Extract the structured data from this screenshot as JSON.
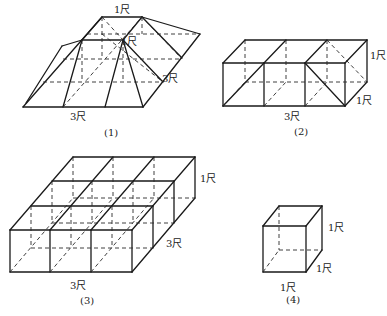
{
  "figures": [
    {
      "id": "fig1",
      "caption": "(1)",
      "caption_pos": [
        104,
        136
      ],
      "labels": [
        {
          "text": "1尺",
          "x": 114,
          "y": 13
        },
        {
          "text": "1尺",
          "x": 121,
          "y": 45
        },
        {
          "text": "3尺",
          "x": 162,
          "y": 82
        },
        {
          "text": "3尺",
          "x": 70,
          "y": 120
        }
      ],
      "solid": [
        [
          [
            23,
            107
          ],
          [
            143,
            107
          ]
        ],
        [
          [
            143,
            107
          ],
          [
            200,
            34
          ]
        ],
        [
          [
            200,
            34
          ],
          [
            142,
            17
          ]
        ],
        [
          [
            142,
            17
          ],
          [
            102,
            17
          ]
        ],
        [
          [
            102,
            17
          ],
          [
            23,
            107
          ]
        ],
        [
          [
            102,
            17
          ],
          [
            82,
            40
          ]
        ],
        [
          [
            82,
            40
          ],
          [
            123,
            40
          ]
        ],
        [
          [
            142,
            17
          ],
          [
            123,
            40
          ]
        ],
        [
          [
            82,
            40
          ],
          [
            63,
            107
          ]
        ],
        [
          [
            123,
            40
          ],
          [
            105,
            107
          ]
        ],
        [
          [
            123,
            40
          ],
          [
            143,
            107
          ]
        ],
        [
          [
            142,
            17
          ],
          [
            182,
            58
          ]
        ],
        [
          [
            123,
            40
          ],
          [
            163,
            82
          ]
        ],
        [
          [
            82,
            40
          ],
          [
            62,
            46
          ]
        ],
        [
          [
            62,
            46
          ],
          [
            26,
            103
          ]
        ]
      ],
      "dash": [
        [
          [
            63,
            59
          ],
          [
            182,
            59
          ]
        ],
        [
          [
            43,
            82
          ],
          [
            163,
            82
          ]
        ],
        [
          [
            87,
            34
          ],
          [
            200,
            34
          ]
        ],
        [
          [
            102,
            17
          ],
          [
            102,
            59
          ]
        ],
        [
          [
            142,
            17
          ],
          [
            142,
            34
          ]
        ],
        [
          [
            82,
            40
          ],
          [
            82,
            82
          ]
        ],
        [
          [
            123,
            40
          ],
          [
            123,
            82
          ]
        ],
        [
          [
            102,
            17
          ],
          [
            123,
            40
          ]
        ],
        [
          [
            63,
            107
          ],
          [
            142,
            17
          ]
        ],
        [
          [
            102,
            34
          ],
          [
            163,
            82
          ]
        ],
        [
          [
            142,
            17
          ],
          [
            182,
            59
          ]
        ]
      ]
    },
    {
      "id": "fig2",
      "caption": "(2)",
      "caption_pos": [
        294,
        135
      ],
      "labels": [
        {
          "text": "1尺",
          "x": 370,
          "y": 59
        },
        {
          "text": "1尺",
          "x": 356,
          "y": 104
        },
        {
          "text": "3尺",
          "x": 284,
          "y": 120
        }
      ],
      "solid": [
        [
          [
            223,
            63
          ],
          [
            345,
            63
          ]
        ],
        [
          [
            223,
            106
          ],
          [
            345,
            106
          ]
        ],
        [
          [
            223,
            63
          ],
          [
            223,
            106
          ]
        ],
        [
          [
            264,
            63
          ],
          [
            264,
            106
          ]
        ],
        [
          [
            305,
            63
          ],
          [
            305,
            106
          ]
        ],
        [
          [
            345,
            63
          ],
          [
            345,
            106
          ]
        ],
        [
          [
            245,
            40
          ],
          [
            367,
            40
          ]
        ],
        [
          [
            223,
            63
          ],
          [
            245,
            40
          ]
        ],
        [
          [
            264,
            63
          ],
          [
            286,
            40
          ]
        ],
        [
          [
            305,
            63
          ],
          [
            327,
            40
          ]
        ],
        [
          [
            345,
            63
          ],
          [
            367,
            40
          ]
        ],
        [
          [
            367,
            40
          ],
          [
            367,
            82
          ]
        ],
        [
          [
            345,
            106
          ],
          [
            367,
            82
          ]
        ],
        [
          [
            223,
            106
          ],
          [
            264,
            63
          ]
        ],
        [
          [
            305,
            63
          ],
          [
            345,
            106
          ]
        ]
      ],
      "dash": [
        [
          [
            245,
            40
          ],
          [
            245,
            82
          ]
        ],
        [
          [
            286,
            40
          ],
          [
            286,
            82
          ]
        ],
        [
          [
            327,
            40
          ],
          [
            327,
            82
          ]
        ],
        [
          [
            245,
            82
          ],
          [
            367,
            82
          ]
        ],
        [
          [
            223,
            106
          ],
          [
            245,
            82
          ]
        ],
        [
          [
            264,
            106
          ],
          [
            286,
            82
          ]
        ],
        [
          [
            305,
            106
          ],
          [
            327,
            82
          ]
        ],
        [
          [
            327,
            40
          ],
          [
            367,
            82
          ]
        ]
      ]
    },
    {
      "id": "fig3",
      "caption": "(3)",
      "caption_pos": [
        80,
        304
      ],
      "labels": [
        {
          "text": "1尺",
          "x": 200,
          "y": 182
        },
        {
          "text": "3尺",
          "x": 166,
          "y": 247
        },
        {
          "text": "3尺",
          "x": 70,
          "y": 289
        }
      ],
      "solid": [
        [
          [
            10,
            230
          ],
          [
            132,
            230
          ]
        ],
        [
          [
            10,
            272
          ],
          [
            132,
            272
          ]
        ],
        [
          [
            10,
            230
          ],
          [
            10,
            272
          ]
        ],
        [
          [
            50,
            230
          ],
          [
            50,
            272
          ]
        ],
        [
          [
            91,
            230
          ],
          [
            91,
            272
          ]
        ],
        [
          [
            132,
            230
          ],
          [
            132,
            272
          ]
        ],
        [
          [
            31,
            206
          ],
          [
            153,
            206
          ]
        ],
        [
          [
            52,
            181
          ],
          [
            174,
            181
          ]
        ],
        [
          [
            73,
            157
          ],
          [
            195,
            157
          ]
        ],
        [
          [
            10,
            230
          ],
          [
            73,
            157
          ]
        ],
        [
          [
            50,
            230
          ],
          [
            113,
            157
          ]
        ],
        [
          [
            91,
            230
          ],
          [
            154,
            157
          ]
        ],
        [
          [
            132,
            230
          ],
          [
            195,
            157
          ]
        ],
        [
          [
            153,
            206
          ],
          [
            153,
            248
          ]
        ],
        [
          [
            174,
            181
          ],
          [
            174,
            223
          ]
        ],
        [
          [
            195,
            157
          ],
          [
            195,
            198
          ]
        ],
        [
          [
            132,
            272
          ],
          [
            195,
            198
          ]
        ]
      ],
      "dash": [
        [
          [
            31,
            248
          ],
          [
            153,
            248
          ]
        ],
        [
          [
            52,
            223
          ],
          [
            174,
            223
          ]
        ],
        [
          [
            73,
            198
          ],
          [
            195,
            198
          ]
        ],
        [
          [
            31,
            206
          ],
          [
            31,
            248
          ]
        ],
        [
          [
            52,
            181
          ],
          [
            52,
            223
          ]
        ],
        [
          [
            73,
            157
          ],
          [
            73,
            198
          ]
        ],
        [
          [
            71,
            206
          ],
          [
            71,
            248
          ]
        ],
        [
          [
            92,
            181
          ],
          [
            92,
            223
          ]
        ],
        [
          [
            113,
            157
          ],
          [
            113,
            198
          ]
        ],
        [
          [
            112,
            206
          ],
          [
            112,
            248
          ]
        ],
        [
          [
            133,
            181
          ],
          [
            133,
            223
          ]
        ],
        [
          [
            154,
            157
          ],
          [
            154,
            198
          ]
        ],
        [
          [
            10,
            272
          ],
          [
            73,
            198
          ]
        ],
        [
          [
            50,
            272
          ],
          [
            113,
            198
          ]
        ],
        [
          [
            91,
            272
          ],
          [
            154,
            198
          ]
        ]
      ]
    },
    {
      "id": "fig4",
      "caption": "(4)",
      "caption_pos": [
        286,
        303
      ],
      "labels": [
        {
          "text": "1尺",
          "x": 328,
          "y": 231
        },
        {
          "text": "1尺",
          "x": 316,
          "y": 272
        },
        {
          "text": "1尺",
          "x": 280,
          "y": 291
        }
      ],
      "solid": [
        [
          [
            263,
            226
          ],
          [
            306,
            226
          ]
        ],
        [
          [
            263,
            272
          ],
          [
            306,
            272
          ]
        ],
        [
          [
            263,
            226
          ],
          [
            263,
            272
          ]
        ],
        [
          [
            306,
            226
          ],
          [
            306,
            272
          ]
        ],
        [
          [
            279,
            206
          ],
          [
            322,
            206
          ]
        ],
        [
          [
            263,
            226
          ],
          [
            279,
            206
          ]
        ],
        [
          [
            306,
            226
          ],
          [
            322,
            206
          ]
        ],
        [
          [
            322,
            206
          ],
          [
            322,
            250
          ]
        ],
        [
          [
            306,
            272
          ],
          [
            322,
            250
          ]
        ]
      ],
      "dash": [
        [
          [
            279,
            206
          ],
          [
            279,
            250
          ]
        ],
        [
          [
            279,
            250
          ],
          [
            322,
            250
          ]
        ],
        [
          [
            263,
            272
          ],
          [
            279,
            250
          ]
        ]
      ]
    }
  ]
}
